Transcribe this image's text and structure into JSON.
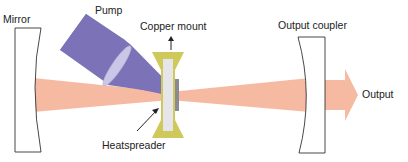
{
  "diagram": {
    "type": "laser-cavity-schematic",
    "labels": {
      "mirror": "Mirror",
      "pump": "Pump",
      "copper_mount": "Copper mount",
      "output_coupler": "Output coupler",
      "output": "Output",
      "heatspreader": "Heatspreader"
    },
    "colors": {
      "beam": "#f5b49a",
      "pump": "#7b72b8",
      "lens": "#c9c6e6",
      "copper_mount": "#cfc85a",
      "heatspreader": "#e6e6ea",
      "gain_chip": "#8a8a92",
      "outline": "#333333"
    },
    "components": [
      {
        "id": "mirror",
        "label": "Mirror"
      },
      {
        "id": "pump",
        "label": "Pump"
      },
      {
        "id": "lens",
        "label": ""
      },
      {
        "id": "copper-mount",
        "label": "Copper mount"
      },
      {
        "id": "heatspreader",
        "label": "Heatspreader"
      },
      {
        "id": "gain-chip",
        "label": ""
      },
      {
        "id": "output-coupler",
        "label": "Output coupler"
      },
      {
        "id": "output-beam",
        "label": "Output"
      }
    ]
  }
}
